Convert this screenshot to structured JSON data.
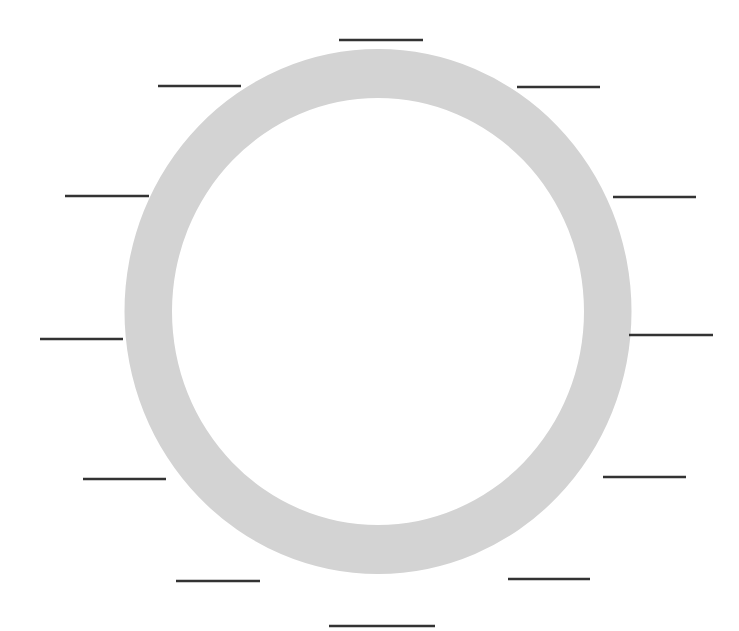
{
  "diagram": {
    "title": "",
    "canvas": {
      "width": 739,
      "height": 631,
      "background": "#ffffff"
    },
    "ring": {
      "cx": 378,
      "cy": 311.5,
      "rx_outer": 253.5,
      "ry_outer": 262.5,
      "rx_inner": 206,
      "ry_inner": 213.5,
      "color": "#d3d3d3"
    },
    "line_color": "#333333",
    "label_lines": [
      {
        "id": "top",
        "x1": 339,
        "x2": 423,
        "y": 40,
        "text": ""
      },
      {
        "id": "upper-left",
        "x1": 158,
        "x2": 241,
        "y": 86,
        "text": ""
      },
      {
        "id": "upper-right",
        "x1": 517,
        "x2": 600,
        "y": 87,
        "text": ""
      },
      {
        "id": "left-upper",
        "x1": 65,
        "x2": 149,
        "y": 196,
        "text": ""
      },
      {
        "id": "right-upper",
        "x1": 613,
        "x2": 696,
        "y": 197,
        "text": ""
      },
      {
        "id": "left-middle",
        "x1": 40,
        "x2": 123,
        "y": 339,
        "text": ""
      },
      {
        "id": "right-middle",
        "x1": 629,
        "x2": 713,
        "y": 335,
        "text": ""
      },
      {
        "id": "left-lower",
        "x1": 83,
        "x2": 166,
        "y": 479,
        "text": ""
      },
      {
        "id": "right-lower",
        "x1": 603,
        "x2": 686,
        "y": 477,
        "text": ""
      },
      {
        "id": "lower-left",
        "x1": 176,
        "x2": 260,
        "y": 581,
        "text": ""
      },
      {
        "id": "lower-right",
        "x1": 508,
        "x2": 590,
        "y": 579,
        "text": ""
      },
      {
        "id": "bottom",
        "x1": 329,
        "x2": 435,
        "y": 626,
        "text": ""
      }
    ]
  }
}
